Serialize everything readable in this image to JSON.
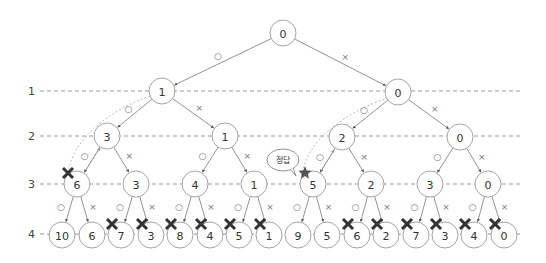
{
  "diagram": {
    "type": "binary decision tree (backtracking / pruning)",
    "edge_labels": {
      "include": "○",
      "exclude": "×"
    },
    "colors": {
      "node_stroke": "#9a9a9a",
      "edge": "#777777",
      "level_line": "#999999",
      "prune_mark": "#333333",
      "answer_star": "#555555"
    },
    "levels": [
      {
        "label": "1",
        "y": 91
      },
      {
        "label": "2",
        "y": 136
      },
      {
        "label": "3",
        "y": 184
      },
      {
        "label": "4",
        "y": 234
      }
    ],
    "nodes": [
      {
        "id": "r",
        "value": "0",
        "x": 283,
        "y": 33,
        "r": 13
      },
      {
        "id": "a",
        "value": "1",
        "x": 162,
        "y": 91,
        "r": 13
      },
      {
        "id": "b",
        "value": "0",
        "x": 398,
        "y": 92,
        "r": 13
      },
      {
        "id": "aa",
        "value": "3",
        "x": 107,
        "y": 136,
        "r": 13
      },
      {
        "id": "ab",
        "value": "1",
        "x": 225,
        "y": 136,
        "r": 13
      },
      {
        "id": "ba",
        "value": "2",
        "x": 342,
        "y": 137,
        "r": 13
      },
      {
        "id": "bb",
        "value": "0",
        "x": 460,
        "y": 137,
        "r": 13
      },
      {
        "id": "aaa",
        "value": "6",
        "x": 77,
        "y": 184,
        "r": 13,
        "mark": "prune"
      },
      {
        "id": "aab",
        "value": "3",
        "x": 136,
        "y": 184,
        "r": 13
      },
      {
        "id": "aba",
        "value": "4",
        "x": 195,
        "y": 184,
        "r": 13
      },
      {
        "id": "abb",
        "value": "1",
        "x": 254,
        "y": 184,
        "r": 13
      },
      {
        "id": "baa",
        "value": "5",
        "x": 313,
        "y": 184,
        "r": 13,
        "mark": "star"
      },
      {
        "id": "bab",
        "value": "2",
        "x": 371,
        "y": 184,
        "r": 13
      },
      {
        "id": "bba",
        "value": "3",
        "x": 430,
        "y": 184,
        "r": 13
      },
      {
        "id": "bbb",
        "value": "0",
        "x": 488,
        "y": 184,
        "r": 13
      },
      {
        "id": "l1",
        "value": "10",
        "x": 62,
        "y": 235,
        "r": 13
      },
      {
        "id": "l2",
        "value": "6",
        "x": 92,
        "y": 235,
        "r": 13
      },
      {
        "id": "l3",
        "value": "7",
        "x": 121,
        "y": 235,
        "r": 13,
        "mark": "prune"
      },
      {
        "id": "l4",
        "value": "3",
        "x": 151,
        "y": 235,
        "r": 13,
        "mark": "prune"
      },
      {
        "id": "l5",
        "value": "8",
        "x": 180,
        "y": 235,
        "r": 13,
        "mark": "prune"
      },
      {
        "id": "l6",
        "value": "4",
        "x": 210,
        "y": 235,
        "r": 13,
        "mark": "prune"
      },
      {
        "id": "l7",
        "value": "5",
        "x": 239,
        "y": 235,
        "r": 13,
        "mark": "prune"
      },
      {
        "id": "l8",
        "value": "1",
        "x": 269,
        "y": 235,
        "r": 13,
        "mark": "prune"
      },
      {
        "id": "l9",
        "value": "9",
        "x": 298,
        "y": 235,
        "r": 13
      },
      {
        "id": "l10",
        "value": "5",
        "x": 327,
        "y": 235,
        "r": 13
      },
      {
        "id": "l11",
        "value": "6",
        "x": 357,
        "y": 235,
        "r": 13,
        "mark": "prune"
      },
      {
        "id": "l12",
        "value": "2",
        "x": 386,
        "y": 235,
        "r": 13,
        "mark": "prune"
      },
      {
        "id": "l13",
        "value": "7",
        "x": 416,
        "y": 235,
        "r": 13,
        "mark": "prune"
      },
      {
        "id": "l14",
        "value": "3",
        "x": 445,
        "y": 235,
        "r": 13,
        "mark": "prune"
      },
      {
        "id": "l15",
        "value": "4",
        "x": 474,
        "y": 235,
        "r": 13,
        "mark": "prune"
      },
      {
        "id": "l16",
        "value": "0",
        "x": 504,
        "y": 235,
        "r": 13,
        "mark": "prune"
      }
    ],
    "edges": [
      {
        "from": "r",
        "to": "a",
        "label": "○"
      },
      {
        "from": "r",
        "to": "b",
        "label": "×"
      },
      {
        "from": "a",
        "to": "aa",
        "label": "○"
      },
      {
        "from": "a",
        "to": "ab",
        "label": "×"
      },
      {
        "from": "b",
        "to": "ba",
        "label": "○"
      },
      {
        "from": "b",
        "to": "bb",
        "label": "×"
      },
      {
        "from": "aa",
        "to": "aaa",
        "label": "○"
      },
      {
        "from": "aa",
        "to": "aab",
        "label": "×"
      },
      {
        "from": "ab",
        "to": "aba",
        "label": "○"
      },
      {
        "from": "ab",
        "to": "abb",
        "label": "×"
      },
      {
        "from": "ba",
        "to": "baa",
        "label": "○"
      },
      {
        "from": "ba",
        "to": "bab",
        "label": "×"
      },
      {
        "from": "bb",
        "to": "bba",
        "label": "○"
      },
      {
        "from": "bb",
        "to": "bbb",
        "label": "×"
      },
      {
        "from": "aaa",
        "to": "l1",
        "label": "○"
      },
      {
        "from": "aaa",
        "to": "l2",
        "label": "×"
      },
      {
        "from": "aab",
        "to": "l3",
        "label": "○"
      },
      {
        "from": "aab",
        "to": "l4",
        "label": "×"
      },
      {
        "from": "aba",
        "to": "l5",
        "label": "○"
      },
      {
        "from": "aba",
        "to": "l6",
        "label": "×"
      },
      {
        "from": "abb",
        "to": "l7",
        "label": "○"
      },
      {
        "from": "abb",
        "to": "l8",
        "label": "×"
      },
      {
        "from": "baa",
        "to": "l9",
        "label": "○"
      },
      {
        "from": "baa",
        "to": "l10",
        "label": "×"
      },
      {
        "from": "bab",
        "to": "l11",
        "label": "○"
      },
      {
        "from": "bab",
        "to": "l12",
        "label": "×"
      },
      {
        "from": "bba",
        "to": "l13",
        "label": "○"
      },
      {
        "from": "bba",
        "to": "l14",
        "label": "×"
      },
      {
        "from": "bbb",
        "to": "l15",
        "label": "○"
      },
      {
        "from": "bbb",
        "to": "l16",
        "label": "×"
      }
    ],
    "backtrack_paths": [
      {
        "name": "backtrack-from-6",
        "d": "M150,96 C110,110 70,140 68,176"
      },
      {
        "name": "backtrack-6-to-3",
        "d": "M82,176 L100,148"
      },
      {
        "name": "backtrack-from-5",
        "d": "M388,98 C350,110 305,140 302,176"
      },
      {
        "name": "backtrack-5-to-2",
        "d": "M318,176 L334,150"
      }
    ],
    "callout": {
      "text": "정답",
      "x": 283,
      "y": 160
    }
  }
}
